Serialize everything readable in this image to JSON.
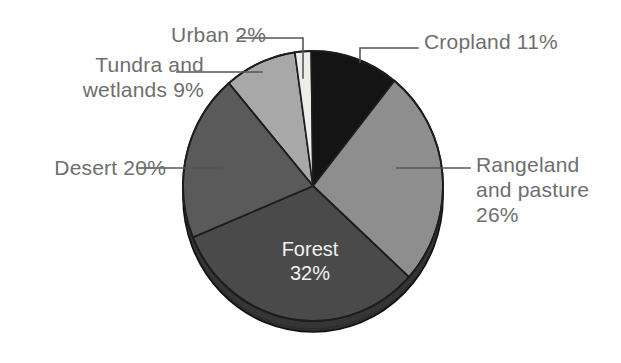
{
  "chart_data": {
    "type": "pie",
    "title": "",
    "subtitle": "",
    "xlabel": "",
    "ylabel": "",
    "legend_position": "callout-labels",
    "grid": false,
    "value_unit": "percent",
    "total": 100,
    "categories": [
      "Urban",
      "Cropland",
      "Rangeland and pasture",
      "Forest",
      "Desert",
      "Tundra and wetlands"
    ],
    "values": [
      2,
      11,
      26,
      32,
      20,
      9
    ],
    "slices": [
      {
        "name": "Urban",
        "label": "Urban 2%",
        "value": 2,
        "value_text": "2%",
        "color": "#ededea",
        "label_placement": "callout-top-left",
        "start_angle_deg": 352,
        "end_angle_deg": 359.2
      },
      {
        "name": "Cropland",
        "label": "Cropland 11%",
        "value": 11,
        "value_text": "11%",
        "color": "#141414",
        "label_placement": "callout-top-right",
        "start_angle_deg": 359.2,
        "end_angle_deg": 38.8
      },
      {
        "name": "Rangeland and pasture",
        "label": "Rangeland\nand pasture\n26%",
        "value": 26,
        "value_text": "26%",
        "color": "#8e8e8e",
        "label_placement": "callout-right",
        "start_angle_deg": 38.8,
        "end_angle_deg": 132.4
      },
      {
        "name": "Forest",
        "label": "Forest\n32%",
        "value": 32,
        "value_text": "32%",
        "color": "#4a4a4a",
        "label_placement": "inside",
        "start_angle_deg": 132.4,
        "end_angle_deg": 247.6
      },
      {
        "name": "Desert",
        "label": "Desert 20%",
        "value": 20,
        "value_text": "20%",
        "color": "#5a5a5a",
        "label_placement": "callout-left",
        "start_angle_deg": 247.6,
        "end_angle_deg": 319.6
      },
      {
        "name": "Tundra and wetlands",
        "label": "Tundra and\nwetlands 9%",
        "value": 9,
        "value_text": "9%",
        "color": "#a8a8a8",
        "label_placement": "callout-upper-left",
        "start_angle_deg": 319.6,
        "end_angle_deg": 352
      }
    ]
  },
  "labels": {
    "urban": "Urban 2%",
    "tundra": "Tundra and\nwetlands 9%",
    "desert": "Desert 20%",
    "cropland": "Cropland 11%",
    "rangeland": "Rangeland\nand pasture\n26%",
    "forest": "Forest\n32%"
  },
  "colors": {
    "background": "#ffffff",
    "label_text": "#6e6e6e",
    "inside_label_text": "#f2f2f2",
    "leader_line": "#555555",
    "slice_edge": "#1d1d1d",
    "rim_shadow": "#2e2e2e",
    "urban": "#ededea",
    "cropland": "#141414",
    "rangeland": "#8e8e8e",
    "forest": "#4a4a4a",
    "desert": "#5a5a5a",
    "tundra": "#a8a8a8"
  }
}
